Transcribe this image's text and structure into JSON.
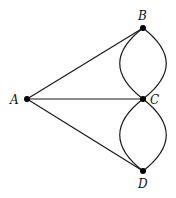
{
  "diagram": {
    "type": "multigraph",
    "colors": {
      "stroke": "#1a1a1a",
      "node": "#000000",
      "background": "#ffffff"
    },
    "nodes": [
      {
        "id": "A",
        "label": "A",
        "x": 27,
        "y": 99
      },
      {
        "id": "B",
        "label": "B",
        "x": 143,
        "y": 28
      },
      {
        "id": "C",
        "label": "C",
        "x": 143,
        "y": 99
      },
      {
        "id": "D",
        "label": "D",
        "x": 143,
        "y": 171
      }
    ],
    "edges": [
      {
        "from": "A",
        "to": "B",
        "shape": "straight"
      },
      {
        "from": "A",
        "to": "C",
        "shape": "straight"
      },
      {
        "from": "A",
        "to": "D",
        "shape": "straight"
      },
      {
        "from": "B",
        "to": "C",
        "shape": "curve-left"
      },
      {
        "from": "B",
        "to": "C",
        "shape": "curve-right"
      },
      {
        "from": "C",
        "to": "D",
        "shape": "curve-left"
      },
      {
        "from": "C",
        "to": "D",
        "shape": "curve-right"
      }
    ]
  }
}
